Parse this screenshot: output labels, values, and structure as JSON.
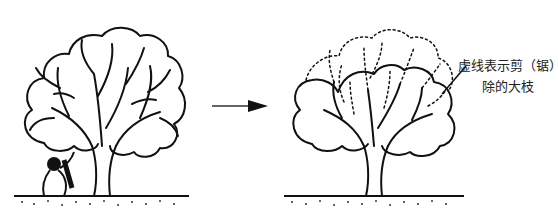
{
  "figure": {
    "panels": [
      {
        "id": "before",
        "description": "tree before pruning, person kneeling at base with saw"
      },
      {
        "id": "after",
        "description": "tree after pruning, large branches to be removed drawn dashed"
      }
    ],
    "arrow": {
      "direction": "right"
    },
    "annotation": {
      "line1": "虚线表示剪（锯）",
      "line2": "除的大枝"
    },
    "colors": {
      "ink": "#111111",
      "background": "#ffffff"
    }
  }
}
